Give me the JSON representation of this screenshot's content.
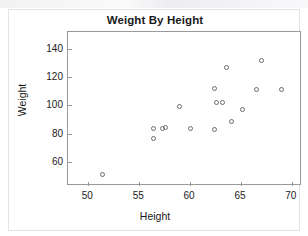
{
  "chart_data": {
    "type": "scatter",
    "title": "Weight By Height",
    "xlabel": "Height",
    "ylabel": "Weight",
    "xlim": [
      48.0,
      71.0
    ],
    "ylim": [
      43.0,
      152.0
    ],
    "xticks": [
      50,
      55,
      60,
      65,
      70
    ],
    "yticks": [
      60,
      80,
      100,
      120,
      140
    ],
    "xtick_labels": [
      "50",
      "55",
      "60",
      "65",
      "70"
    ],
    "ytick_labels": [
      "60",
      "80",
      "100",
      "120",
      "140"
    ],
    "grid": false,
    "legend": false,
    "marker": "open-circle",
    "marker_color": "#6b6b6b",
    "frame_color": "#9a9a9a",
    "points": [
      {
        "x": 51.4,
        "y": 51
      },
      {
        "x": 56.4,
        "y": 83.5
      },
      {
        "x": 56.4,
        "y": 76.5
      },
      {
        "x": 57.3,
        "y": 84.0
      },
      {
        "x": 57.6,
        "y": 84.5
      },
      {
        "x": 59.0,
        "y": 99.0
      },
      {
        "x": 60.0,
        "y": 84.0
      },
      {
        "x": 62.4,
        "y": 112.0
      },
      {
        "x": 62.4,
        "y": 83.0
      },
      {
        "x": 62.6,
        "y": 102.0
      },
      {
        "x": 63.2,
        "y": 102.0
      },
      {
        "x": 63.6,
        "y": 127.0
      },
      {
        "x": 64.1,
        "y": 89.0
      },
      {
        "x": 65.2,
        "y": 97.0
      },
      {
        "x": 66.5,
        "y": 111.0
      },
      {
        "x": 67.0,
        "y": 132.0
      },
      {
        "x": 69.0,
        "y": 111.5
      },
      {
        "x": 72.1,
        "y": 148.0
      }
    ]
  }
}
